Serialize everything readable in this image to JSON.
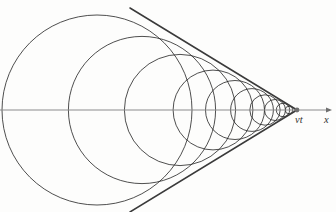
{
  "figure": {
    "kind": "geometric-physics-diagram",
    "width": 336,
    "height": 212,
    "background_color": "#fdfdfc"
  },
  "labels": {
    "source_position": "vt",
    "axis": "x"
  },
  "colors": {
    "circle_stroke": "#222222",
    "mach_line_stroke": "#3a3a3a",
    "axis_stroke": "#8c8c8c",
    "marker_fill": "#6f6f6f",
    "label_fill": "#333333"
  },
  "chart_data": {
    "type": "scatter",
    "xlabel": "x",
    "ylabel": "",
    "axis": {
      "y": 110,
      "x_start": 0,
      "x_end": 332,
      "arrow_tip_x": 332,
      "label": "x",
      "label_x": 324,
      "label_y": 123
    },
    "source": {
      "label": "vt",
      "apex_x": 297,
      "apex_y": 110,
      "label_x": 295,
      "label_y": 123,
      "dot_radius": 2.4
    },
    "mach_angle_sin": 0.475,
    "mach_lines": [
      {
        "name": "upper-mach-line",
        "x1": 130,
        "y1": 8,
        "x2": 297,
        "y2": 110
      },
      {
        "name": "lower-mach-line",
        "x1": 130,
        "y1": 212,
        "x2": 297,
        "y2": 110
      }
    ],
    "circles": [
      {
        "index": 1,
        "cx": 97,
        "cy": 110,
        "r": 95
      },
      {
        "index": 2,
        "cx": 142,
        "cy": 110,
        "r": 73.6
      },
      {
        "index": 3,
        "cx": 180,
        "cy": 110,
        "r": 55.6
      },
      {
        "index": 4,
        "cx": 213,
        "cy": 110,
        "r": 39.9
      },
      {
        "index": 5,
        "cx": 235,
        "cy": 110,
        "r": 29.5
      },
      {
        "index": 6,
        "cx": 252,
        "cy": 110,
        "r": 21.4
      },
      {
        "index": 7,
        "cx": 265,
        "cy": 110,
        "r": 15.2
      },
      {
        "index": 8,
        "cx": 275,
        "cy": 110,
        "r": 10.5
      },
      {
        "index": 9,
        "cx": 283,
        "cy": 110,
        "r": 6.7
      },
      {
        "index": 10,
        "cx": 289,
        "cy": 110,
        "r": 3.8
      }
    ]
  }
}
